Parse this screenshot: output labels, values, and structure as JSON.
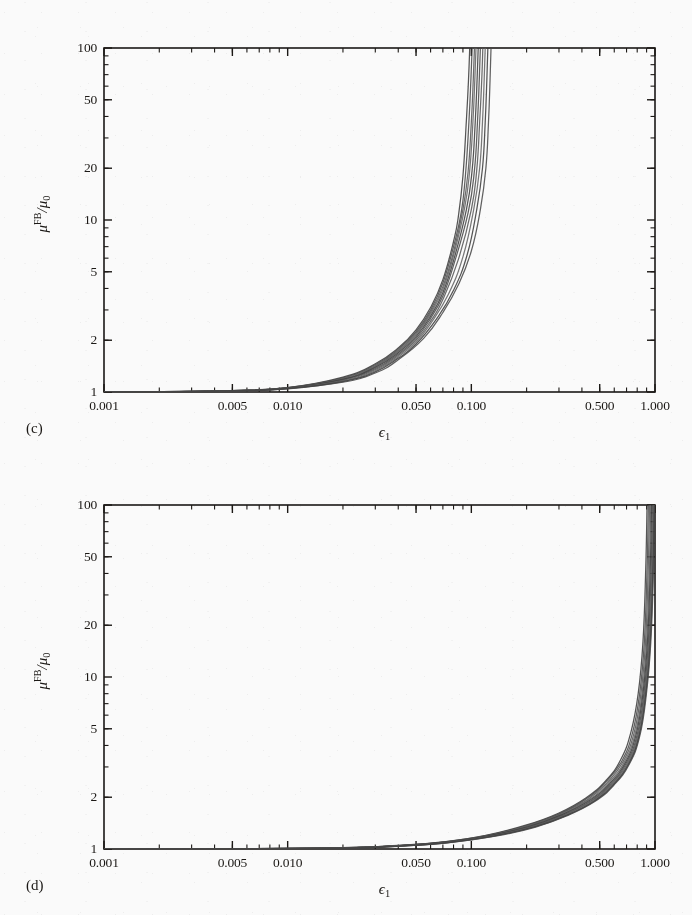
{
  "figure": {
    "background_color": "#ffffff",
    "ink_color": "#15120f",
    "curve_color": "#4a4a4a"
  },
  "panels": [
    {
      "letter": "(c)",
      "xlabel_symbol": "ϵ",
      "xlabel_sub": "1",
      "ylabel_mu": "μ",
      "ylabel_sup": "FB",
      "ylabel_slash": "/μ",
      "ylabel_sub": "0",
      "xticks": [
        "0.001",
        "0.005",
        "0.010",
        "0.050",
        "0.100",
        "0.500",
        "1.000"
      ],
      "yticks": [
        "1",
        "2",
        "5",
        "10",
        "20",
        "50",
        "100"
      ]
    },
    {
      "letter": "(d)",
      "xlabel_symbol": "ϵ",
      "xlabel_sub": "1",
      "ylabel_mu": "μ",
      "ylabel_sup": "FB",
      "ylabel_slash": "/μ",
      "ylabel_sub": "0",
      "xticks": [
        "0.001",
        "0.005",
        "0.010",
        "0.050",
        "0.100",
        "0.500",
        "1.000"
      ],
      "yticks": [
        "1",
        "2",
        "5",
        "10",
        "20",
        "50",
        "100"
      ]
    }
  ],
  "chart_data": [
    {
      "type": "line",
      "panel": "(c)",
      "title": "",
      "xlabel": "ϵ₁",
      "ylabel": "μ^FB/μ₀",
      "xscale": "log",
      "yscale": "log",
      "xlim": [
        0.001,
        1.0
      ],
      "ylim": [
        1,
        100
      ],
      "xticks": [
        0.001,
        0.005,
        0.01,
        0.05,
        0.1,
        0.5,
        1.0
      ],
      "xticklabels": [
        "0.001",
        "0.005",
        "0.010",
        "0.050",
        "0.100",
        "0.500",
        "1.000"
      ],
      "yticks": [
        1,
        2,
        5,
        10,
        20,
        50,
        100
      ],
      "yticklabels": [
        "1",
        "2",
        "5",
        "10",
        "20",
        "50",
        "100"
      ],
      "grid": false,
      "legend": "none",
      "n_series": 10,
      "description": "Bundle of ten near-coincident monotonically increasing curves rising from mu^FB/mu0 = 1 and diverging (vertical asymptote) near epsilon_1 = 0.10-0.13.",
      "series": [
        {
          "name": "curve-1",
          "asymptote_x": 0.098,
          "x": [
            0.001,
            0.002,
            0.005,
            0.01,
            0.02,
            0.03,
            0.04,
            0.05,
            0.06,
            0.07,
            0.08,
            0.085,
            0.09,
            0.094,
            0.0965,
            0.098
          ],
          "y": [
            1.0,
            1.005,
            1.02,
            1.06,
            1.22,
            1.46,
            1.8,
            2.3,
            3.1,
            4.5,
            7.5,
            10.5,
            18.0,
            38.0,
            65.0,
            100.0
          ]
        },
        {
          "name": "curve-2",
          "asymptote_x": 0.101,
          "x": [
            0.001,
            0.002,
            0.005,
            0.01,
            0.02,
            0.03,
            0.04,
            0.05,
            0.06,
            0.07,
            0.08,
            0.088,
            0.093,
            0.097,
            0.0995,
            0.101
          ],
          "y": [
            1.0,
            1.005,
            1.02,
            1.06,
            1.21,
            1.44,
            1.77,
            2.24,
            3.0,
            4.3,
            7.0,
            11.0,
            18.5,
            37.0,
            66.0,
            100.0
          ]
        },
        {
          "name": "curve-3",
          "asymptote_x": 0.104,
          "x": [
            0.001,
            0.002,
            0.005,
            0.01,
            0.02,
            0.03,
            0.04,
            0.05,
            0.06,
            0.07,
            0.08,
            0.09,
            0.096,
            0.1,
            0.1025,
            0.104
          ],
          "y": [
            1.0,
            1.004,
            1.019,
            1.058,
            1.2,
            1.42,
            1.74,
            2.19,
            2.92,
            4.1,
            6.5,
            11.5,
            19.0,
            37.0,
            66.0,
            100.0
          ]
        },
        {
          "name": "curve-4",
          "asymptote_x": 0.106,
          "x": [
            0.001,
            0.002,
            0.005,
            0.01,
            0.02,
            0.03,
            0.04,
            0.05,
            0.06,
            0.07,
            0.08,
            0.092,
            0.098,
            0.102,
            0.1045,
            0.106
          ],
          "y": [
            1.0,
            1.004,
            1.018,
            1.056,
            1.19,
            1.41,
            1.72,
            2.15,
            2.85,
            3.95,
            6.2,
            11.8,
            19.5,
            37.0,
            66.0,
            100.0
          ]
        },
        {
          "name": "curve-5",
          "asymptote_x": 0.109,
          "x": [
            0.001,
            0.002,
            0.005,
            0.01,
            0.02,
            0.03,
            0.04,
            0.05,
            0.06,
            0.07,
            0.08,
            0.094,
            0.101,
            0.105,
            0.1075,
            0.109
          ],
          "y": [
            1.0,
            1.004,
            1.018,
            1.054,
            1.185,
            1.39,
            1.69,
            2.1,
            2.76,
            3.78,
            5.8,
            11.5,
            19.5,
            37.0,
            66.0,
            100.0
          ]
        },
        {
          "name": "curve-6",
          "asymptote_x": 0.112,
          "x": [
            0.001,
            0.002,
            0.005,
            0.01,
            0.02,
            0.03,
            0.04,
            0.05,
            0.06,
            0.07,
            0.08,
            0.096,
            0.104,
            0.108,
            0.1105,
            0.112
          ],
          "y": [
            1.0,
            1.004,
            1.017,
            1.052,
            1.18,
            1.37,
            1.66,
            2.05,
            2.68,
            3.62,
            5.45,
            11.0,
            19.5,
            37.0,
            66.0,
            100.0
          ]
        },
        {
          "name": "curve-7",
          "asymptote_x": 0.1155,
          "x": [
            0.001,
            0.002,
            0.005,
            0.01,
            0.02,
            0.03,
            0.04,
            0.05,
            0.06,
            0.07,
            0.085,
            0.1,
            0.107,
            0.111,
            0.114,
            0.1155
          ],
          "y": [
            1.0,
            1.004,
            1.016,
            1.05,
            1.17,
            1.35,
            1.63,
            2.0,
            2.58,
            3.45,
            5.9,
            11.5,
            19.5,
            37.0,
            66.0,
            100.0
          ]
        },
        {
          "name": "curve-8",
          "asymptote_x": 0.119,
          "x": [
            0.001,
            0.002,
            0.005,
            0.01,
            0.02,
            0.03,
            0.04,
            0.05,
            0.06,
            0.075,
            0.09,
            0.103,
            0.111,
            0.115,
            0.1175,
            0.119
          ],
          "y": [
            1.0,
            1.003,
            1.015,
            1.048,
            1.16,
            1.33,
            1.6,
            1.95,
            2.5,
            3.7,
            6.1,
            11.5,
            20.0,
            37.0,
            66.0,
            100.0
          ]
        },
        {
          "name": "curve-9",
          "asymptote_x": 0.123,
          "x": [
            0.001,
            0.002,
            0.005,
            0.01,
            0.02,
            0.03,
            0.04,
            0.05,
            0.065,
            0.08,
            0.095,
            0.107,
            0.115,
            0.119,
            0.1215,
            0.123
          ],
          "y": [
            1.0,
            1.003,
            1.014,
            1.046,
            1.15,
            1.31,
            1.57,
            1.9,
            2.68,
            3.9,
            6.3,
            11.5,
            20.0,
            37.0,
            66.0,
            100.0
          ]
        },
        {
          "name": "curve-10",
          "asymptote_x": 0.128,
          "x": [
            0.001,
            0.002,
            0.005,
            0.01,
            0.02,
            0.03,
            0.04,
            0.055,
            0.07,
            0.085,
            0.1,
            0.112,
            0.12,
            0.124,
            0.1265,
            0.128
          ],
          "y": [
            1.0,
            1.003,
            1.013,
            1.044,
            1.14,
            1.29,
            1.54,
            2.05,
            2.9,
            4.2,
            6.6,
            11.5,
            20.0,
            37.0,
            66.0,
            100.0
          ]
        }
      ]
    },
    {
      "type": "line",
      "panel": "(d)",
      "title": "",
      "xlabel": "ϵ₁",
      "ylabel": "μ^FB/μ₀",
      "xscale": "log",
      "yscale": "log",
      "xlim": [
        0.001,
        1.0
      ],
      "ylim": [
        1,
        100
      ],
      "xticks": [
        0.001,
        0.005,
        0.01,
        0.05,
        0.1,
        0.5,
        1.0
      ],
      "xticklabels": [
        "0.001",
        "0.005",
        "0.010",
        "0.050",
        "0.100",
        "0.500",
        "1.000"
      ],
      "yticks": [
        1,
        2,
        5,
        10,
        20,
        50,
        100
      ],
      "yticklabels": [
        "1",
        "2",
        "5",
        "10",
        "20",
        "50",
        "100"
      ],
      "grid": false,
      "legend": "none",
      "n_series": 10,
      "description": "Bundle of ten near-coincident monotonically increasing curves rising from mu^FB/mu0 = 1 and diverging (vertical asymptote) near epsilon_1 = 0.9-1.0.",
      "series": [
        {
          "name": "curve-1",
          "asymptote_x": 0.905,
          "x": [
            0.001,
            0.005,
            0.02,
            0.04,
            0.07,
            0.12,
            0.2,
            0.3,
            0.42,
            0.54,
            0.65,
            0.74,
            0.81,
            0.86,
            0.89,
            0.905
          ],
          "y": [
            1.0,
            1.002,
            1.018,
            1.05,
            1.1,
            1.2,
            1.38,
            1.62,
            1.98,
            2.5,
            3.3,
            4.8,
            8.0,
            16.0,
            42.0,
            100.0
          ]
        },
        {
          "name": "curve-2",
          "asymptote_x": 0.92,
          "x": [
            0.001,
            0.005,
            0.02,
            0.04,
            0.07,
            0.12,
            0.2,
            0.3,
            0.42,
            0.54,
            0.66,
            0.755,
            0.825,
            0.875,
            0.905,
            0.92
          ],
          "y": [
            1.0,
            1.002,
            1.017,
            1.048,
            1.098,
            1.195,
            1.37,
            1.6,
            1.95,
            2.46,
            3.25,
            4.75,
            8.0,
            16.0,
            42.0,
            100.0
          ]
        },
        {
          "name": "curve-3",
          "asymptote_x": 0.934,
          "x": [
            0.001,
            0.005,
            0.02,
            0.04,
            0.07,
            0.12,
            0.2,
            0.3,
            0.43,
            0.55,
            0.67,
            0.768,
            0.838,
            0.888,
            0.918,
            0.934
          ],
          "y": [
            1.0,
            1.002,
            1.016,
            1.046,
            1.095,
            1.19,
            1.36,
            1.59,
            1.94,
            2.44,
            3.22,
            4.7,
            8.0,
            16.0,
            42.0,
            100.0
          ]
        },
        {
          "name": "curve-4",
          "asymptote_x": 0.947,
          "x": [
            0.001,
            0.005,
            0.02,
            0.04,
            0.07,
            0.12,
            0.2,
            0.305,
            0.435,
            0.558,
            0.68,
            0.78,
            0.85,
            0.9,
            0.931,
            0.947
          ],
          "y": [
            1.0,
            1.002,
            1.016,
            1.045,
            1.093,
            1.188,
            1.355,
            1.585,
            1.93,
            2.42,
            3.2,
            4.68,
            8.0,
            16.0,
            42.0,
            100.0
          ]
        },
        {
          "name": "curve-5",
          "asymptote_x": 0.958,
          "x": [
            0.001,
            0.005,
            0.02,
            0.04,
            0.07,
            0.12,
            0.205,
            0.31,
            0.442,
            0.566,
            0.69,
            0.79,
            0.86,
            0.91,
            0.942,
            0.958
          ],
          "y": [
            1.0,
            1.002,
            1.015,
            1.044,
            1.091,
            1.185,
            1.35,
            1.58,
            1.92,
            2.4,
            3.18,
            4.65,
            8.0,
            16.0,
            42.0,
            100.0
          ]
        },
        {
          "name": "curve-6",
          "asymptote_x": 0.968,
          "x": [
            0.001,
            0.005,
            0.02,
            0.04,
            0.07,
            0.125,
            0.21,
            0.315,
            0.448,
            0.574,
            0.698,
            0.8,
            0.87,
            0.92,
            0.952,
            0.968
          ],
          "y": [
            1.0,
            1.002,
            1.015,
            1.043,
            1.089,
            1.19,
            1.35,
            1.575,
            1.91,
            2.39,
            3.16,
            4.62,
            8.0,
            16.0,
            42.0,
            100.0
          ]
        },
        {
          "name": "curve-7",
          "asymptote_x": 0.977,
          "x": [
            0.001,
            0.005,
            0.02,
            0.04,
            0.072,
            0.128,
            0.214,
            0.32,
            0.454,
            0.581,
            0.706,
            0.808,
            0.878,
            0.929,
            0.961,
            0.977
          ],
          "y": [
            1.0,
            1.002,
            1.014,
            1.042,
            1.09,
            1.19,
            1.348,
            1.57,
            1.9,
            2.38,
            3.14,
            4.6,
            8.0,
            16.0,
            42.0,
            100.0
          ]
        },
        {
          "name": "curve-8",
          "asymptote_x": 0.984,
          "x": [
            0.001,
            0.005,
            0.02,
            0.042,
            0.074,
            0.131,
            0.218,
            0.325,
            0.46,
            0.587,
            0.713,
            0.815,
            0.885,
            0.936,
            0.968,
            0.984
          ],
          "y": [
            1.0,
            1.002,
            1.014,
            1.042,
            1.09,
            1.19,
            1.346,
            1.568,
            1.895,
            2.37,
            3.13,
            4.58,
            8.0,
            16.0,
            42.0,
            100.0
          ]
        },
        {
          "name": "curve-9",
          "asymptote_x": 0.991,
          "x": [
            0.001,
            0.005,
            0.02,
            0.042,
            0.075,
            0.133,
            0.221,
            0.329,
            0.465,
            0.593,
            0.719,
            0.821,
            0.892,
            0.943,
            0.975,
            0.991
          ],
          "y": [
            1.0,
            1.002,
            1.013,
            1.041,
            1.089,
            1.188,
            1.344,
            1.565,
            1.89,
            2.36,
            3.12,
            4.57,
            8.0,
            16.0,
            42.0,
            100.0
          ]
        },
        {
          "name": "curve-10",
          "asymptote_x": 0.997,
          "x": [
            0.001,
            0.005,
            0.02,
            0.042,
            0.076,
            0.135,
            0.224,
            0.333,
            0.47,
            0.598,
            0.724,
            0.827,
            0.898,
            0.949,
            0.981,
            0.997
          ],
          "y": [
            1.0,
            1.002,
            1.013,
            1.04,
            1.088,
            1.186,
            1.342,
            1.562,
            1.888,
            2.355,
            3.11,
            4.56,
            8.0,
            16.0,
            42.0,
            100.0
          ]
        }
      ]
    }
  ]
}
